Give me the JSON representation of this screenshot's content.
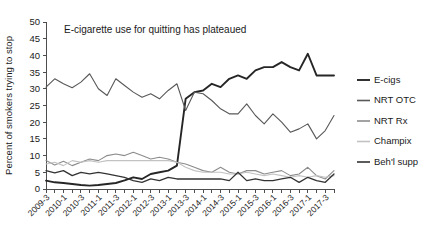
{
  "chart_data": {
    "type": "line",
    "title": "",
    "annotation": "E-cigarette use for quitting has plateaued",
    "xlabel": "",
    "ylabel": "Percent of smokers trying to stop",
    "ylim": [
      0,
      50
    ],
    "yticks": [
      0,
      5,
      10,
      15,
      20,
      25,
      30,
      35,
      40,
      45,
      50
    ],
    "grid": false,
    "legend_position": "right",
    "x": [
      "2009-3",
      "2009-4",
      "2010-1",
      "2010-2",
      "2010-3",
      "2010-4",
      "2011-1",
      "2011-2",
      "2011-3",
      "2011-4",
      "2012-1",
      "2012-2",
      "2012-3",
      "2012-4",
      "2013-1",
      "2013-2",
      "2013-3",
      "2013-4",
      "2014-1",
      "2014-2",
      "2014-3",
      "2014-4",
      "2015-1",
      "2015-2",
      "2015-3",
      "2015-4",
      "2016-1",
      "2016-2",
      "2016-3",
      "2016-4",
      "2017-1",
      "2017-2",
      "2017-3",
      "2017-4"
    ],
    "xtick_labels": [
      "2009-3",
      "2010-1",
      "2010-3",
      "2011-1",
      "2011-3",
      "2012-1",
      "2012-3",
      "2013-1",
      "2013-3",
      "2014-1",
      "2014-3",
      "2015-1",
      "2015-3",
      "2016-1",
      "2016-3",
      "2017-1",
      "2017-3"
    ],
    "xtick_indices": [
      0,
      2,
      4,
      6,
      8,
      10,
      12,
      14,
      16,
      18,
      20,
      22,
      24,
      26,
      28,
      30,
      32
    ],
    "series": [
      {
        "name": "E-cigs",
        "color": "#262626",
        "width": 1.9,
        "values": [
          2.5,
          2.0,
          1.8,
          1.5,
          1.2,
          1.0,
          1.2,
          1.5,
          1.8,
          2.6,
          3.5,
          3.0,
          4.5,
          5.0,
          5.5,
          7.0,
          27.0,
          29.0,
          29.5,
          31.5,
          30.5,
          33.0,
          34.0,
          33.0,
          35.5,
          36.5,
          36.5,
          38.0,
          36.5,
          35.5,
          40.5,
          34.0,
          34.0,
          34.0
        ]
      },
      {
        "name": "NRT OTC",
        "color": "#585858",
        "width": 1.1,
        "values": [
          30.5,
          33.0,
          31.5,
          30.3,
          32.0,
          34.5,
          30.0,
          28.0,
          33.0,
          31.0,
          29.0,
          27.5,
          28.5,
          27.0,
          29.5,
          31.5,
          23.5,
          29.0,
          28.5,
          26.5,
          24.0,
          22.5,
          22.5,
          25.5,
          22.0,
          19.5,
          22.5,
          20.0,
          17.0,
          18.0,
          19.5,
          15.0,
          17.5,
          22.0
        ]
      },
      {
        "name": "NRT Rx",
        "color": "#8c8c8c",
        "width": 1.1,
        "values": [
          8.5,
          7.2,
          8.3,
          7.0,
          8.0,
          9.0,
          8.5,
          10.0,
          10.5,
          10.0,
          11.0,
          10.0,
          9.0,
          9.5,
          9.0,
          8.0,
          7.5,
          6.5,
          5.5,
          5.0,
          6.5,
          5.0,
          4.5,
          5.5,
          5.5,
          4.5,
          5.0,
          5.5,
          4.0,
          4.5,
          6.5,
          4.0,
          3.0,
          5.5
        ]
      },
      {
        "name": "Champix",
        "color": "#c2c2c2",
        "width": 1.1,
        "values": [
          7.5,
          8.0,
          7.0,
          8.5,
          8.0,
          8.5,
          8.0,
          8.5,
          8.5,
          8.5,
          8.5,
          8.5,
          8.5,
          8.5,
          8.5,
          8.0,
          6.5,
          5.5,
          5.0,
          5.0,
          5.0,
          4.5,
          4.5,
          5.0,
          4.5,
          4.0,
          4.5,
          4.0,
          3.5,
          4.0,
          3.5,
          4.0,
          3.5,
          4.0
        ]
      },
      {
        "name": "Beh'l supp",
        "color": "#333333",
        "width": 1.3,
        "values": [
          5.5,
          4.8,
          5.5,
          4.0,
          5.0,
          4.5,
          5.0,
          4.5,
          4.0,
          3.5,
          2.5,
          2.0,
          3.0,
          2.5,
          3.5,
          3.0,
          3.0,
          3.0,
          3.0,
          3.0,
          3.0,
          2.5,
          5.0,
          2.5,
          3.0,
          2.5,
          2.5,
          3.0,
          3.5,
          2.0,
          3.5,
          2.5,
          2.0,
          4.5
        ]
      }
    ]
  }
}
